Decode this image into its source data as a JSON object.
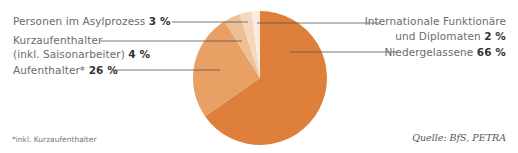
{
  "chart_data": {
    "type": "pie",
    "title": "",
    "slices": [
      {
        "label": "Niedergelassene",
        "value": 66,
        "color": "#df7f3c"
      },
      {
        "label": "Aufenthalter*",
        "value": 26,
        "color": "#e9a064"
      },
      {
        "label": "Kurzaufenthalter (inkl. Saisonarbeiter)",
        "value": 4,
        "color": "#eebf94"
      },
      {
        "label": "Personen im Asylprozess",
        "value": 3,
        "color": "#f4d8bc"
      },
      {
        "label": "Internationale Funktionäre und Diplomaten",
        "value": 2,
        "color": "#faece0"
      }
    ],
    "unit": "%",
    "footnote": "*inkl. Kurzaufenthalter",
    "source": "Quelle: BfS, PETRA"
  },
  "labels": {
    "asyl": {
      "text": "Personen im Asylprozess ",
      "value": "3 %"
    },
    "kurz_line1": "Kurzaufenthalter",
    "kurz": {
      "text": "(inkl. Saisonarbeiter) ",
      "value": "4 %"
    },
    "aufent": {
      "text": "Aufenthalter* ",
      "value": "26 %"
    },
    "intl_line1": "Internationale Funktionäre",
    "intl": {
      "text": "und Diplomaten ",
      "value": "2 %"
    },
    "nieder": {
      "text": "Niedergelassene ",
      "value": "66 %"
    }
  },
  "footnote": "*inkl. Kurzaufenthalter",
  "source": "Quelle: BfS, PETRA"
}
